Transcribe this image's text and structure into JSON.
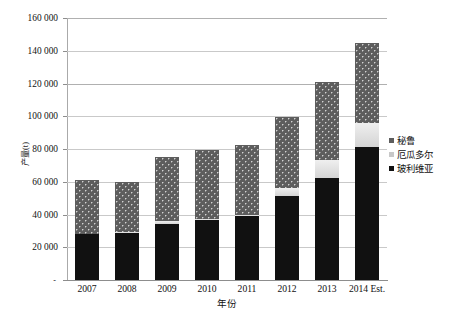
{
  "chart_data": {
    "type": "bar",
    "subtype": "stacked-bar",
    "title": "",
    "xlabel": "年份",
    "ylabel": "产量(t)",
    "ylim": [
      0,
      160000
    ],
    "ytick_step": 20000,
    "ytick_labels": [
      "160 000",
      "140 000",
      "120 000",
      "100 000",
      "80 000",
      "60 000",
      "40 000",
      "20 000",
      "-"
    ],
    "ytick_values": [
      160000,
      140000,
      120000,
      100000,
      80000,
      60000,
      40000,
      20000,
      0
    ],
    "grid": true,
    "legend_position": "right",
    "categories": [
      "2007",
      "2008",
      "2009",
      "2010",
      "2011",
      "2012",
      "2013",
      "2014 Est."
    ],
    "series": [
      {
        "name": "玻利维亚",
        "color": "#111111",
        "values": [
          28000,
          29000,
          34500,
          36500,
          39000,
          51500,
          62000,
          81000
        ]
      },
      {
        "name": "厄瓜多尔",
        "color": "#d8d8d8",
        "values": [
          300,
          300,
          1500,
          1000,
          1000,
          4500,
          11000,
          15000
        ]
      },
      {
        "name": "秘鲁",
        "color": "#5d5d5d",
        "values": [
          32700,
          30700,
          39000,
          42000,
          42500,
          43500,
          48000,
          49000
        ]
      }
    ],
    "totals": [
      61000,
      60000,
      75000,
      79500,
      82500,
      99500,
      121000,
      145000
    ],
    "legend_entries": [
      "秘鲁",
      "厄瓜多尔",
      "玻利维亚"
    ]
  },
  "colors": {
    "bolivia": "#111111",
    "ecuador": "#d8d8d8",
    "peru": "#5d5d5d",
    "gridline": "#c9c9c9",
    "axis": "#8d8d8d",
    "background": "#ffffff"
  }
}
